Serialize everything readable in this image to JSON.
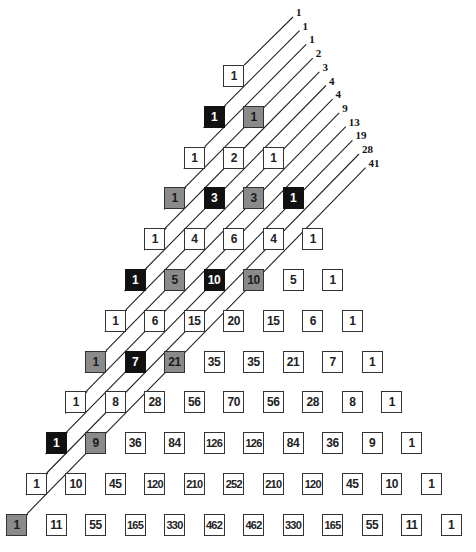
{
  "diagram": {
    "colors": {
      "black": "#111111",
      "gray": "#8a8a8a",
      "white": "#ffffff",
      "line": "#222222"
    },
    "rows": [
      [
        1
      ],
      [
        1,
        1
      ],
      [
        1,
        2,
        1
      ],
      [
        1,
        3,
        3,
        1
      ],
      [
        1,
        4,
        6,
        4,
        1
      ],
      [
        1,
        5,
        10,
        10,
        5,
        1
      ],
      [
        1,
        6,
        15,
        20,
        15,
        6,
        1
      ],
      [
        1,
        7,
        21,
        35,
        35,
        21,
        7,
        1
      ],
      [
        1,
        8,
        28,
        56,
        70,
        56,
        28,
        8,
        1
      ],
      [
        1,
        9,
        36,
        84,
        126,
        126,
        84,
        36,
        9,
        1
      ],
      [
        1,
        10,
        45,
        120,
        210,
        252,
        210,
        120,
        45,
        10,
        1
      ],
      [
        1,
        11,
        55,
        165,
        330,
        462,
        462,
        330,
        165,
        55,
        11,
        1
      ]
    ],
    "highlights": {
      "1": {
        "0": "black",
        "1": "gray"
      },
      "3": {
        "0": "gray",
        "1": "black",
        "2": "gray",
        "3": "black"
      },
      "5": {
        "0": "black",
        "1": "gray",
        "2": "black",
        "3": "gray"
      },
      "7": {
        "0": "gray",
        "1": "black",
        "2": "gray"
      },
      "9": {
        "0": "black",
        "1": "gray"
      },
      "11": {
        "0": "gray"
      }
    },
    "diagonal_sums": [
      "1",
      "1",
      "1",
      "2",
      "3",
      "4",
      "4",
      "9",
      "13",
      "19",
      "28",
      "41"
    ]
  }
}
